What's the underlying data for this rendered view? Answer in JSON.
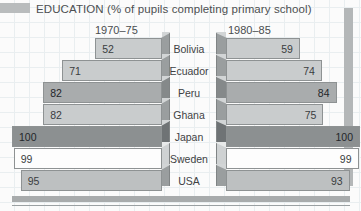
{
  "title": "EDUCATION (% of pupils completing primary school)",
  "periods": {
    "left": "1970–75",
    "right": "1980–85"
  },
  "countries": [
    "Bolivia",
    "Ecuador",
    "Peru",
    "Ghana",
    "Japan",
    "Sweden",
    "USA"
  ],
  "chart_data": {
    "type": "bar",
    "title": "EDUCATION (% of pupils completing primary school)",
    "xlabel": "",
    "ylabel": "",
    "xlim": [
      0,
      100
    ],
    "grid": true,
    "orientation": "horizontal-diverging",
    "categories": [
      "Bolivia",
      "Ecuador",
      "Peru",
      "Ghana",
      "Japan",
      "Sweden",
      "USA"
    ],
    "series": [
      {
        "name": "1970–75",
        "values": [
          52,
          71,
          82,
          82,
          100,
          99,
          95
        ]
      },
      {
        "name": "1980–85",
        "values": [
          59,
          74,
          84,
          75,
          100,
          99,
          93
        ]
      }
    ],
    "colors": {
      "bar_default": "#c9cccd",
      "bar_medium": "#a9acad",
      "bar_dark": "#8c9091",
      "bar_white": "#fdfdfd",
      "outline": "#8e9293",
      "grid": "#e9eef0"
    },
    "bar_fills": {
      "left": [
        "#c9cccd",
        "#c9cccd",
        "#a9acad",
        "#c9cccd",
        "#8c9091",
        "#fdfdfd",
        "#bdc0c1"
      ],
      "right": [
        "#c9cccd",
        "#c9cccd",
        "#a9acad",
        "#c9cccd",
        "#8c9091",
        "#fdfdfd",
        "#bdc0c1"
      ]
    }
  },
  "labels": {
    "left": [
      "52",
      "71",
      "82",
      "82",
      "100",
      "99",
      "95"
    ],
    "right": [
      "59",
      "74",
      "84",
      "75",
      "100",
      "99",
      "93"
    ]
  }
}
